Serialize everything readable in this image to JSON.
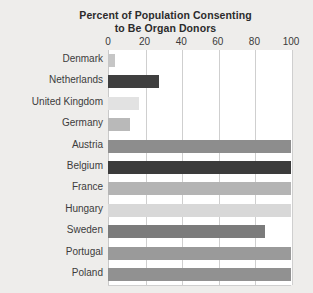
{
  "chart_data": {
    "type": "bar",
    "orientation": "horizontal",
    "title": "Percent of Population Consenting to Be Organ Donors",
    "title_lines": [
      "Percent of Population Consenting",
      "to Be Organ Donors"
    ],
    "xlabel": "",
    "ylabel": "",
    "xlim": [
      0,
      100
    ],
    "ticks": [
      0,
      20,
      40,
      60,
      80,
      100
    ],
    "tick_labels": [
      "0",
      "20",
      "40",
      "60",
      "80",
      "100"
    ],
    "grid": true,
    "legend": "none",
    "categories": [
      "Denmark",
      "Netherlands",
      "United Kingdom",
      "Germany",
      "Austria",
      "Belgium",
      "France",
      "Hungary",
      "Sweden",
      "Portugal",
      "Poland"
    ],
    "values": [
      4,
      28,
      17,
      12,
      100,
      100,
      100,
      100,
      86,
      100,
      100
    ],
    "bar_colors": [
      "#c6c6c6",
      "#3f3f3f",
      "#e2e2e2",
      "#b9b9b9",
      "#8d8d8d",
      "#3b3b3b",
      "#b4b4b4",
      "#d8d8d8",
      "#7b7b7b",
      "#9a9a9a",
      "#919191"
    ]
  },
  "style": {
    "page_background": "#eeedeb",
    "plot_background": "#ffffff",
    "grid_color": "#cfcfcf",
    "title_color": "#2b2b2b",
    "label_color": "#3c3c3c"
  }
}
